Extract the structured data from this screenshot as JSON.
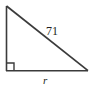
{
  "figure": {
    "shape": "right triangle",
    "stroke_color": "#3b3b3b",
    "label_color": "#231f20",
    "background_color": "#ffffff",
    "vertices": {
      "top_left": [
        6,
        6
      ],
      "bottom_left": [
        6,
        71
      ],
      "bottom_right": [
        88,
        71
      ]
    },
    "right_angle_marker": {
      "name": "right-angle-marker",
      "at_vertex": "bottom_left",
      "size": 8
    }
  },
  "labels": {
    "hypotenuse": "71",
    "base": "r"
  }
}
